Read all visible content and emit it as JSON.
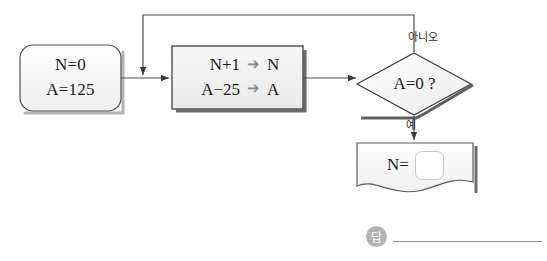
{
  "diagram": {
    "type": "flowchart",
    "title": "",
    "nodes": {
      "start": {
        "shape": "rounded-rectangle",
        "line1": "N=0",
        "line2": "A=125"
      },
      "process": {
        "shape": "rectangle",
        "row1": {
          "lhs": "N+1",
          "operator": "➔",
          "rhs": "N"
        },
        "row2": {
          "lhs": "A−25",
          "operator": "➔",
          "rhs": "A"
        }
      },
      "decision": {
        "shape": "diamond",
        "text": "A=0 ?"
      },
      "output": {
        "shape": "document",
        "label": "N=",
        "blank_value": ""
      }
    },
    "edge_labels": {
      "no": "아니오",
      "yes": "예"
    },
    "answer": {
      "badge": "답",
      "value": ""
    },
    "colors": {
      "stroke": "#555555",
      "node_fill_light": "#fafafa",
      "node_fill_gray": "#f0f0f0",
      "shadow": "#6e6e6e",
      "operator_arrow": "#8b8b8b",
      "background": "#ffffff",
      "badge": "#b3b3b3"
    }
  }
}
